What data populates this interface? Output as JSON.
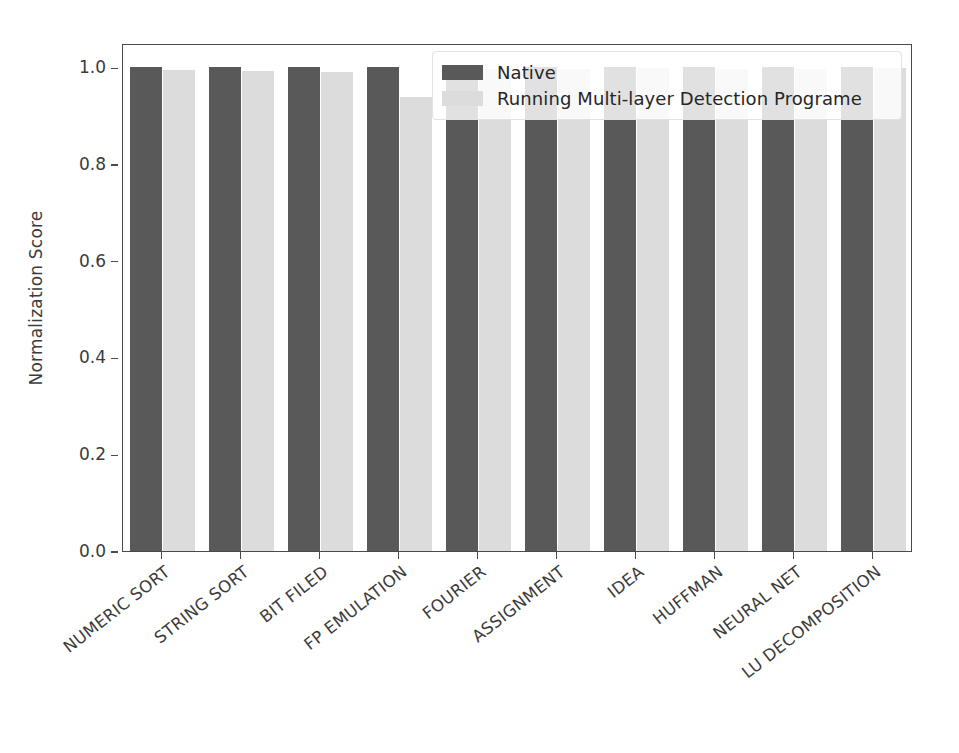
{
  "chart_data": {
    "type": "bar",
    "title": "",
    "xlabel": "",
    "ylabel": "Normalization Score",
    "ylim": [
      0.0,
      1.05
    ],
    "yticks": [
      "0.0",
      "0.2",
      "0.4",
      "0.6",
      "0.8",
      "1.0"
    ],
    "ytick_values": [
      0.0,
      0.2,
      0.4,
      0.6,
      0.8,
      1.0
    ],
    "grid": false,
    "legend_position": "upper right",
    "categories": [
      "NUMERIC SORT",
      "STRING SORT",
      "BIT FILED",
      "FP EMULATION",
      "FOURIER",
      "ASSIGNMENT",
      "IDEA",
      "HUFFMAN",
      "NEURAL NET",
      "LU DECOMPOSITION"
    ],
    "series": [
      {
        "name": "Native",
        "color": "#595959",
        "values": [
          1.0,
          1.0,
          1.0,
          1.0,
          1.0,
          1.0,
          1.0,
          1.0,
          1.0,
          1.0
        ]
      },
      {
        "name": "Running Multi-layer Detection Programe",
        "color": "#dcdcdc",
        "values": [
          0.995,
          0.993,
          0.99,
          0.938,
          0.997,
          0.997,
          0.998,
          0.997,
          0.997,
          0.999
        ]
      }
    ]
  },
  "legend": {
    "entries": [
      {
        "label": "Native",
        "swatch": "native"
      },
      {
        "label": "Running Multi-layer Detection Programe",
        "swatch": "detect"
      }
    ]
  },
  "axis": {
    "y_label": "Normalization Score"
  }
}
